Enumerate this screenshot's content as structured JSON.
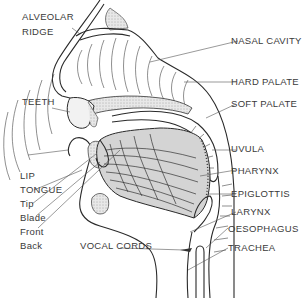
{
  "diagram": {
    "labels": {
      "alveolar_ridge_1": "ALVEOLAR",
      "alveolar_ridge_2": "RIDGE",
      "teeth": "TEETH",
      "lip": "LIP",
      "tongue": "TONGUE",
      "tip": "Tip",
      "blade": "Blade",
      "front": "Front",
      "back": "Back",
      "vocal_cords": "VOCAL CORDS",
      "nasal_cavity": "NASAL CAVITY",
      "hard_palate": "HARD PALATE",
      "soft_palate": "SOFT PALATE",
      "uvula": "UVULA",
      "pharynx": "PHARYNX",
      "epiglottis": "EPIGLOTTIS",
      "larynx": "LARYNX",
      "oesophagus": "OESOPHAGUS",
      "trachea": "TRACHEA"
    },
    "colors": {
      "line": "#2a2a2a",
      "tongue_fill": "#d8d8d8",
      "bone_fill": "#e6e6e6",
      "text": "#3a3a3a"
    }
  }
}
